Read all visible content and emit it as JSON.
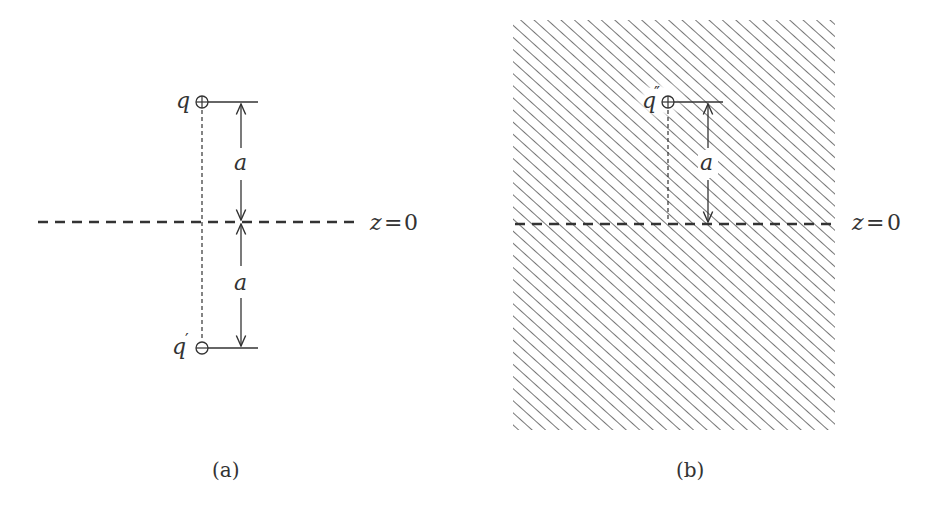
{
  "figure_a": {
    "caption": "(a)",
    "charge_label": "q",
    "image_charge_label": "q",
    "image_charge_prime": "′",
    "distance_upper_label": "a",
    "distance_lower_label": "a",
    "plane_label_var": "z",
    "plane_label_eq": "=",
    "plane_label_val": "0",
    "charge_symbol": "plus",
    "image_charge_symbol": "minus"
  },
  "figure_b": {
    "caption": "(b)",
    "charge_label": "q",
    "charge_primes": "″",
    "distance_label": "a",
    "plane_label_var": "z",
    "plane_label_eq": "=",
    "plane_label_val": "0",
    "charge_symbol": "plus",
    "region": "hatched"
  },
  "colors": {
    "line": "#333333",
    "hatch": "#777777",
    "text": "#333333"
  }
}
